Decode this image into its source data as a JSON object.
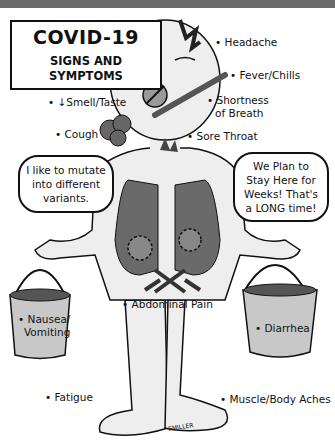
{
  "title": {
    "main": "COVID-19",
    "subtitle_line1": "SIGNS AND",
    "subtitle_line2": "SYMPTOMS"
  },
  "symptoms": {
    "headache": "• Headache",
    "fever": "• Fever/Chills",
    "shortness_line1": "• Shortness",
    "shortness_line2": "of Breath",
    "smell_taste": "• ↓Smell/Taste",
    "cough": "• Cough",
    "sore_throat": "• Sore Throat",
    "abdominal": "• Abdominal Pain",
    "nausea_line1": "• Nausea/",
    "nausea_line2": "Vomiting",
    "diarrhea": "• Diarrhea",
    "fatigue": "• Fatigue",
    "muscle": "• Muscle/Body Aches"
  },
  "bubbles": {
    "left": "I like to mutate into different variants.",
    "right": "We Plan to Stay Here for Weeks! That's a LONG time!"
  },
  "signature": "SMILLER",
  "colors": {
    "topbar": "#6b6b6b",
    "body_fill": "#eeeeee",
    "lung_fill": "#6a6a6a",
    "bucket_fill": "#c8c8c8",
    "outline": "#111111"
  }
}
